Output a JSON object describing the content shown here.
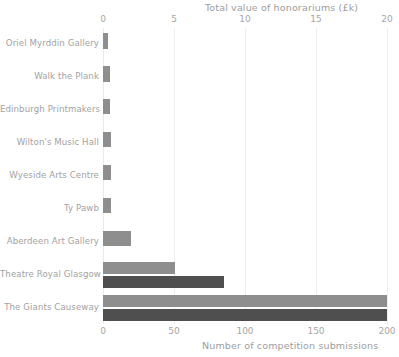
{
  "chart_data": {
    "type": "bar",
    "orientation": "horizontal",
    "title": "",
    "categories": [
      "Oriel Myrddin Gallery",
      "Walk the Plank",
      "Edinburgh Printmakers",
      "Wilton's Music Hall",
      "Wyeside Arts Centre",
      "Ty Pawb",
      "Aberdeen Art Gallery",
      "Theatre Royal Glasgow",
      "The Giants Causeway"
    ],
    "series": [
      {
        "name": "Total value of honorariums (£k)",
        "axis": "top",
        "color": "#8e8e8e",
        "values": [
          0.35,
          0.5,
          0.5,
          0.55,
          0.55,
          0.55,
          2.0,
          5.1,
          20.0
        ]
      },
      {
        "name": "Number of competition submissions",
        "axis": "bottom",
        "color": "#4f4f4f",
        "values": [
          0,
          0,
          0,
          0,
          0,
          0,
          0,
          85,
          200
        ]
      }
    ],
    "top_axis": {
      "label": "Total value of honorariums  (£k)",
      "ticks": [
        0,
        5,
        10,
        15,
        20,
        25
      ],
      "tick_labels": [
        "0",
        "5",
        "10",
        "15",
        "20",
        "2"
      ],
      "range": [
        0,
        20
      ]
    },
    "bottom_axis": {
      "label": "Number of competition submissions",
      "ticks": [
        0,
        50,
        100,
        150,
        200
      ],
      "tick_labels": [
        "0",
        "50",
        "100",
        "150",
        "200"
      ],
      "range": [
        0,
        200
      ]
    },
    "grid": true,
    "legend": "none"
  }
}
